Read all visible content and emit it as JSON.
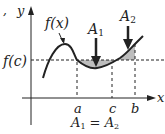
{
  "diagram": {
    "stray_mark": ",",
    "axes": {
      "x_label": "x",
      "y_label": "y"
    },
    "curve_label": "f(x)",
    "level_label": "f(c)",
    "tick_labels": {
      "a": "a",
      "c": "c",
      "b": "b"
    },
    "regions": [
      {
        "label": "A",
        "subscript": "1"
      },
      {
        "label": "A",
        "subscript": "2"
      }
    ],
    "equation": {
      "left": "A",
      "left_sub": "1",
      "op": " = ",
      "right": "A",
      "right_sub": "2"
    },
    "colors": {
      "ink": "#222222",
      "shade": "#bdbdbd",
      "background": "#ffffff"
    }
  }
}
